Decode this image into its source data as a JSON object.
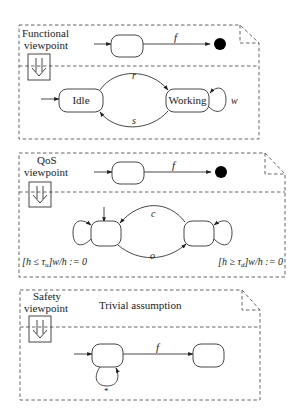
{
  "diagram": {
    "panels": [
      {
        "title_line1": "Functional",
        "title_line2": "viewpoint",
        "refine_icon": "double-down-arrow",
        "top_transition_label": "f",
        "states": [
          {
            "name": "Idle",
            "label": "Idle"
          },
          {
            "name": "Working",
            "label": "Working"
          }
        ],
        "transitions": [
          {
            "from": "Idle",
            "to": "Working",
            "label": "r"
          },
          {
            "from": "Working",
            "to": "Idle",
            "label": "s"
          },
          {
            "from": "Working",
            "to": "Working",
            "label": "w"
          }
        ]
      },
      {
        "title_line1": "QoS",
        "title_line2": "viewpoint",
        "refine_icon": "double-down-arrow",
        "top_transition_label": "f",
        "transitions": [
          {
            "from": "right",
            "to": "left",
            "label": "c"
          },
          {
            "from": "left",
            "to": "right",
            "label": "o"
          }
        ],
        "left_guard": "[h ≤ τ",
        "left_guard_sub": "u",
        "left_guard_tail": "]w/h := 0",
        "right_guard": "[h ≥ τ",
        "right_guard_sub": "d",
        "right_guard_tail": "]w/h := 0"
      },
      {
        "title_line1": "Safety",
        "title_line2": "viewpoint",
        "caption": "Trivial assumption",
        "refine_icon": "double-down-arrow",
        "transition_label": "f",
        "self_loop_label": "*"
      }
    ]
  }
}
